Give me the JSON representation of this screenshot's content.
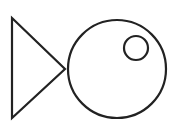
{
  "figure": {
    "stroke_color": "#222222",
    "background": "#ffffff",
    "shapes": {
      "tail": {
        "type": "triangle",
        "points": "12,18 65,69 12,118"
      },
      "body": {
        "type": "circle",
        "cx": 117,
        "cy": 69,
        "r": 49
      },
      "eye": {
        "type": "circle",
        "cx": 136,
        "cy": 48,
        "r": 12
      }
    }
  }
}
